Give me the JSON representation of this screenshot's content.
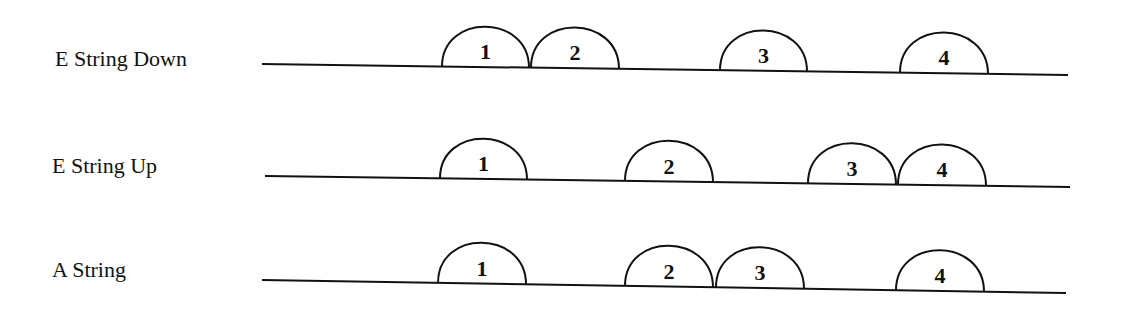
{
  "diagram": {
    "stroke_color": "#111111",
    "background": "#ffffff",
    "rows": [
      {
        "label": "E String Down",
        "label_pos": {
          "x": 55,
          "y": 46
        },
        "line": {
          "x1": 262,
          "y1": 64,
          "x2": 1068,
          "y2": 75
        },
        "arcs": [
          {
            "number": "1",
            "x1": 442,
            "x2": 529
          },
          {
            "number": "2",
            "x1": 531,
            "x2": 619
          },
          {
            "number": "3",
            "x1": 720,
            "x2": 807
          },
          {
            "number": "4",
            "x1": 900,
            "x2": 988
          }
        ]
      },
      {
        "label": "E String Up",
        "label_pos": {
          "x": 52,
          "y": 153
        },
        "line": {
          "x1": 265,
          "y1": 176,
          "x2": 1070,
          "y2": 187
        },
        "arcs": [
          {
            "number": "1",
            "x1": 440,
            "x2": 527
          },
          {
            "number": "2",
            "x1": 625,
            "x2": 713
          },
          {
            "number": "3",
            "x1": 808,
            "x2": 896
          },
          {
            "number": "4",
            "x1": 898,
            "x2": 986
          }
        ]
      },
      {
        "label": "A String",
        "label_pos": {
          "x": 52,
          "y": 257
        },
        "line": {
          "x1": 262,
          "y1": 280,
          "x2": 1066,
          "y2": 293
        },
        "arcs": [
          {
            "number": "1",
            "x1": 438,
            "x2": 526
          },
          {
            "number": "2",
            "x1": 625,
            "x2": 713
          },
          {
            "number": "3",
            "x1": 716,
            "x2": 804
          },
          {
            "number": "4",
            "x1": 896,
            "x2": 984
          }
        ]
      }
    ]
  }
}
